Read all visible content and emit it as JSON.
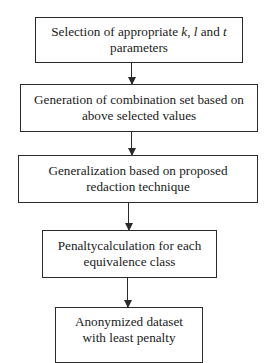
{
  "diagram": {
    "type": "flowchart",
    "direction": "top-to-bottom",
    "nodes": [
      {
        "id": "box1",
        "lines": [
          "Selection of appropriate k, l and t",
          "parameters"
        ],
        "line1_parts": {
          "pre": "Selection of appropriate ",
          "k": "k",
          "sep1": ", ",
          "l": "l",
          "sep2": " and ",
          "t": "t"
        }
      },
      {
        "id": "box2",
        "lines": [
          "Generation of combination set based on",
          "above selected values"
        ]
      },
      {
        "id": "box3",
        "lines": [
          "Generalization based on proposed",
          "redaction technique"
        ]
      },
      {
        "id": "box4",
        "lines": [
          "Penaltycalculation for each",
          "equivalence class"
        ]
      },
      {
        "id": "box5",
        "lines": [
          "Anonymized dataset",
          "with least penalty"
        ]
      }
    ],
    "edges": [
      {
        "from": "box1",
        "to": "box2"
      },
      {
        "from": "box2",
        "to": "box3"
      },
      {
        "from": "box3",
        "to": "box4"
      },
      {
        "from": "box4",
        "to": "box5"
      }
    ],
    "colors": {
      "stroke": "#2a2a2a",
      "background": "#ffffff",
      "text": "#1a1a1a"
    }
  }
}
